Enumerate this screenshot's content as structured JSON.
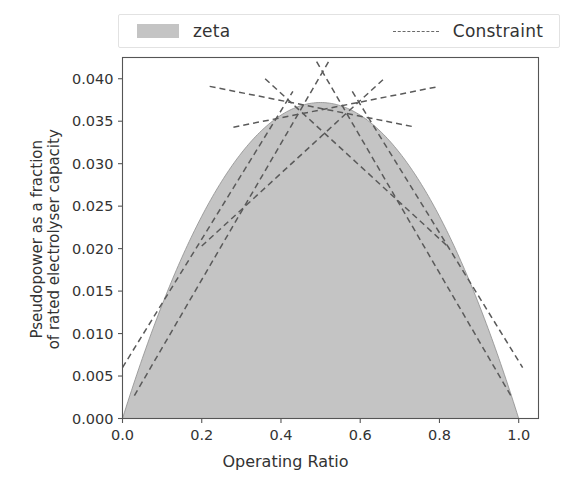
{
  "legend": {
    "entries": [
      {
        "label": "zeta",
        "marker": "area-patch",
        "color": "#c4c4c4"
      },
      {
        "label": "Constraint",
        "marker": "dashed-line",
        "color": "#5a5a5a"
      }
    ]
  },
  "chart_data": {
    "type": "area",
    "title": "",
    "xlabel": "Operating Ratio",
    "ylabel": "Pseudopower as a fraction\nof rated electrolyser capacity",
    "ylabel_line1": "Pseudopower as a fraction",
    "ylabel_line2": "of rated electrolyser capacity",
    "xlim": [
      0.0,
      1.05
    ],
    "ylim": [
      0.0,
      0.0425
    ],
    "xticks": [
      0.0,
      0.2,
      0.4,
      0.6,
      0.8,
      1.0
    ],
    "xticklabels": [
      "0.0",
      "0.2",
      "0.4",
      "0.6",
      "0.8",
      "1.0"
    ],
    "yticks": [
      0.0,
      0.005,
      0.01,
      0.015,
      0.02,
      0.025,
      0.03,
      0.035,
      0.04
    ],
    "yticklabels": [
      "0.000",
      "0.005",
      "0.010",
      "0.015",
      "0.020",
      "0.025",
      "0.030",
      "0.035",
      "0.040"
    ],
    "grid": false,
    "legend_position": "above-axes",
    "series": [
      {
        "name": "zeta",
        "type": "area",
        "fill_color": "#c4c4c4",
        "description": "Quadratic curve zeta = 0.1488 * x * (1 - x), filled to zero baseline, peaking at x=0.5",
        "peak": {
          "x": 0.5,
          "y": 0.0372
        },
        "x": [
          0.0,
          0.05,
          0.1,
          0.15,
          0.2,
          0.25,
          0.3,
          0.35,
          0.4,
          0.45,
          0.5,
          0.55,
          0.6,
          0.65,
          0.7,
          0.75,
          0.8,
          0.85,
          0.9,
          0.95,
          1.0
        ],
        "values": [
          0.0,
          0.0071,
          0.0134,
          0.019,
          0.0238,
          0.0279,
          0.0312,
          0.0339,
          0.0357,
          0.0368,
          0.0372,
          0.0368,
          0.0357,
          0.0339,
          0.0312,
          0.0279,
          0.0238,
          0.019,
          0.0134,
          0.0071,
          0.0
        ]
      },
      {
        "name": "Constraint",
        "type": "line",
        "style": "dashed",
        "color": "#5a5a5a",
        "description": "Piecewise tangent-line constraint segments forming an outer linear envelope of the zeta curve",
        "segments": [
          {
            "label": "tangent-at-0.05",
            "x": [
              0.0,
              0.43
            ],
            "y": [
              0.006,
              0.0385
            ]
          },
          {
            "label": "tangent-at-0.15",
            "x": [
              0.03,
              0.52
            ],
            "y": [
              0.0027,
              0.042
            ]
          },
          {
            "label": "tangent-at-0.30",
            "x": [
              0.2,
              0.66
            ],
            "y": [
              0.0203,
              0.04
            ]
          },
          {
            "label": "tangent-at-0.43",
            "x": [
              0.28,
              0.8
            ],
            "y": [
              0.0343,
              0.0391
            ]
          },
          {
            "label": "tangent-at-0.57",
            "x": [
              0.22,
              0.74
            ],
            "y": [
              0.0391,
              0.0343
            ]
          },
          {
            "label": "tangent-at-0.70",
            "x": [
              0.36,
              0.82
            ],
            "y": [
              0.04,
              0.0203
            ]
          },
          {
            "label": "tangent-at-0.85",
            "x": [
              0.49,
              0.98
            ],
            "y": [
              0.042,
              0.0027
            ]
          },
          {
            "label": "tangent-at-0.95",
            "x": [
              0.58,
              1.01
            ],
            "y": [
              0.0385,
              0.006
            ]
          }
        ]
      }
    ]
  }
}
